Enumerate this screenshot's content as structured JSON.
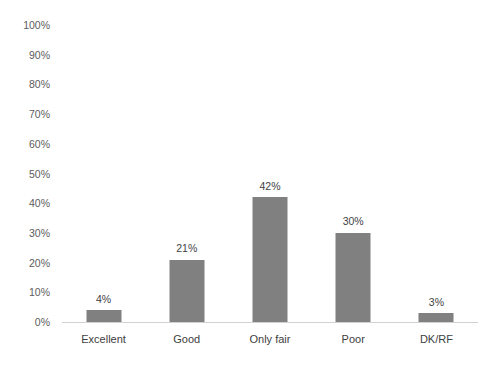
{
  "chart_data": {
    "type": "bar",
    "title": "",
    "subtitle": "",
    "xlabel": "",
    "ylabel": "",
    "categories": [
      "Excellent",
      "Good",
      "Only fair",
      "Poor",
      "DK/RF"
    ],
    "values": [
      4,
      21,
      42,
      30,
      3
    ],
    "value_labels": [
      "4%",
      "21%",
      "42%",
      "30%",
      "3%"
    ],
    "ylim": [
      0,
      100
    ],
    "y_tick_values": [
      0,
      10,
      20,
      30,
      40,
      50,
      60,
      70,
      80,
      90,
      100
    ],
    "y_tick_labels": [
      "0%",
      "10%",
      "20%",
      "30%",
      "40%",
      "50%",
      "60%",
      "70%",
      "80%",
      "90%",
      "100%"
    ],
    "grid": false,
    "legend": null,
    "annotations": [],
    "colors": {
      "bar_fill": "#808080",
      "background": "#ffffff",
      "axis_line": "#d2d2d2",
      "tick_label": "#5c5c5c",
      "category_label": "#404040",
      "data_label": "#3f3f3f"
    }
  }
}
